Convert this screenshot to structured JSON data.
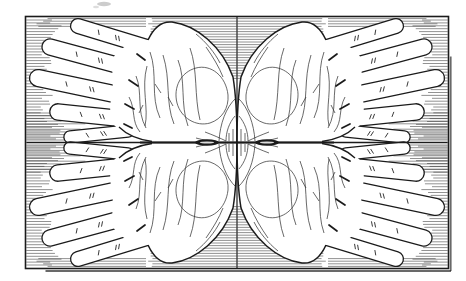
{
  "figure": {
    "kind": "engraving-plate",
    "palette": {
      "paper": "#ffffff",
      "ink": "#1b1b1b",
      "shadow": "#2a2a2a",
      "smudge": "#8f8f8f"
    },
    "frame": {
      "x": 25.5,
      "y": 16.5,
      "width": 423,
      "height": 252
    },
    "center_divider_x": 237,
    "mirror_axis_y": 142.5,
    "hands": {
      "count": 4,
      "digits_per_hand": 5
    },
    "digits": [
      {
        "name": "little-finger",
        "tip": [
          78,
          26
        ],
        "base": [
          147,
          47
        ],
        "half_width": 6.8
      },
      {
        "name": "ring-finger",
        "tip": [
          50,
          47
        ],
        "base": [
          139,
          71
        ],
        "half_width": 7.4
      },
      {
        "name": "middle-finger",
        "tip": [
          38,
          78
        ],
        "base": [
          133,
          98
        ],
        "half_width": 7.8
      },
      {
        "name": "index-finger",
        "tip": [
          58,
          112
        ],
        "base": [
          135,
          120
        ],
        "half_width": 7.6
      },
      {
        "name": "thumb",
        "tip": [
          70,
          137
        ],
        "base": [
          128,
          131
        ],
        "half_width": 5.5
      }
    ],
    "crease_ticks": {
      "single_at": 0.3,
      "double_at": 0.55,
      "length": 4.6
    },
    "hatching": {
      "style": "horizontal",
      "row_spacing": 2.9,
      "line_width": 0.55
    },
    "wrist_lenses": {
      "centers_x": [
        207,
        267
      ],
      "rx": 12,
      "ry": 3.2
    }
  }
}
